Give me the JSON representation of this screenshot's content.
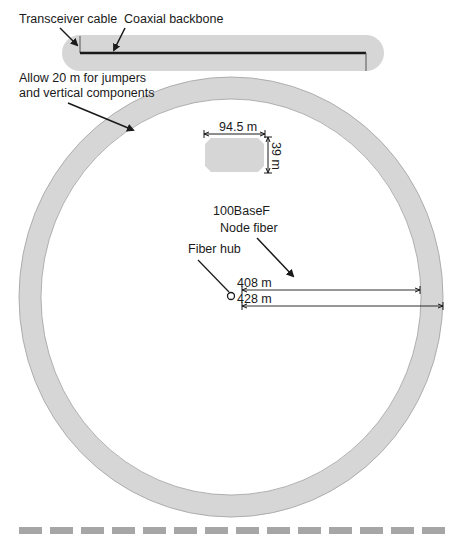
{
  "labels": {
    "transceiver_cable": "Transceiver cable",
    "coaxial_backbone": "Coaxial backbone",
    "allow_line1": "Allow 20 m for jumpers",
    "allow_line2": "and vertical components",
    "building_width": "94.5 m",
    "building_height": "39 m",
    "standard": "100BaseF",
    "node_fiber": "Node fiber",
    "fiber_hub": "Fiber hub",
    "dim_inner": "408 m",
    "dim_outer": "428 m"
  },
  "colors": {
    "ring_fill": "#d6d6d6",
    "ring_stroke": "#9a9a9a",
    "backbone": "#1a1a1a",
    "dash": "#a6a6a6",
    "text": "#1a1a1a"
  },
  "dash_bar": {
    "segments": 14
  }
}
